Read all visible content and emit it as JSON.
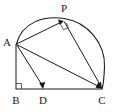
{
  "figure": {
    "background_color": "#ffffff",
    "stroke_color": "#1a1a1a",
    "width": 115,
    "height": 112
  },
  "labels": {
    "a": "A",
    "b": "B",
    "c": "C",
    "d": "D",
    "p": "P"
  },
  "points": {
    "A": {
      "x": 16,
      "y": 44,
      "label": "A",
      "label_x": 7,
      "label_y": 43
    },
    "B": {
      "x": 16,
      "y": 89,
      "label": "B",
      "label_x": 16,
      "label_y": 101
    },
    "C": {
      "x": 102,
      "y": 89,
      "label": "C",
      "label_x": 102,
      "label_y": 101
    },
    "D": {
      "x": 43,
      "y": 89,
      "label": "D",
      "label_x": 43,
      "label_y": 101
    },
    "P": {
      "x": 64,
      "y": 21,
      "label": "P",
      "label_x": 64,
      "label_y": 9
    }
  },
  "segments": [
    {
      "name": "AB",
      "from": "A",
      "to": "B",
      "arrow": false
    },
    {
      "name": "BC",
      "from": "B",
      "to": "C",
      "arrow": false
    },
    {
      "name": "AD",
      "from": "A",
      "to": "D",
      "arrow": true
    },
    {
      "name": "AC",
      "from": "A",
      "to": "C",
      "arrow": true
    },
    {
      "name": "AP",
      "from": "A",
      "to": "P",
      "arrow": true
    },
    {
      "name": "PC",
      "from": "P",
      "to": "C",
      "arrow": true
    }
  ],
  "arc": {
    "name": "semicircle-AC",
    "from": "A",
    "to": "C",
    "description": "arc through P above chord AC",
    "path": "M 16 44 Q 34 14 64 18 Q 98 23 102 89"
  },
  "right_angles": [
    {
      "name": "right-angle-at-B",
      "at": "B",
      "measure": "90"
    },
    {
      "name": "right-angle-at-P",
      "at": "P",
      "measure": "90"
    }
  ]
}
